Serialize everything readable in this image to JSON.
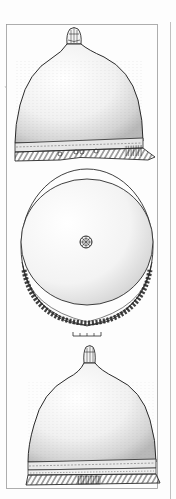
{
  "figure": {
    "views": [
      {
        "id": "side-view-top",
        "label": "side elevation with knob finial and decorated brim"
      },
      {
        "id": "top-view",
        "label": "plan view from above with central rosette and zigzag band"
      },
      {
        "id": "side-view-bottom",
        "label": "second elevation with knob finial and hatched brim"
      }
    ],
    "scale_bar": {
      "ticks": 5,
      "label": ""
    },
    "colors": {
      "ink": "#2a2a2a",
      "stipple": "#8a8a8a",
      "frame": "#9a9a9a",
      "paper": "#fdfdfd"
    }
  }
}
